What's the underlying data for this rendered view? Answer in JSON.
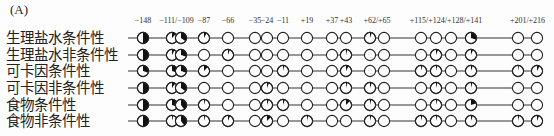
{
  "panel_label": "(A)",
  "site_header_labels": [
    {
      "text": "−148",
      "sites": [
        0
      ]
    },
    {
      "text": "−111/−109",
      "sites": [
        1,
        2
      ]
    },
    {
      "text": "−87",
      "sites": [
        3
      ]
    },
    {
      "text": "−66",
      "sites": [
        4
      ]
    },
    {
      "text": "−35",
      "sites": [
        5
      ]
    },
    {
      "text": "−24",
      "sites": [
        6
      ]
    },
    {
      "text": "−11",
      "sites": [
        7
      ]
    },
    {
      "text": "+19",
      "sites": [
        8
      ]
    },
    {
      "text": "+37",
      "sites": [
        9
      ]
    },
    {
      "text": "+43",
      "sites": [
        10
      ]
    },
    {
      "text": "+62/+65",
      "sites": [
        11,
        12
      ]
    },
    {
      "text": "+115/+124/+128/+141",
      "sites": [
        13,
        14,
        15,
        16
      ]
    },
    {
      "text": "+201/+216",
      "sites": [
        17,
        18
      ]
    }
  ],
  "sites": [
    -148,
    -111,
    -109,
    -87,
    -66,
    -35,
    -24,
    -11,
    19,
    37,
    43,
    62,
    65,
    115,
    124,
    128,
    141,
    201,
    216
  ],
  "fill_color": "#111111",
  "rows": [
    {
      "label": "生理盐水条件性",
      "fills": [
        0.5,
        0.12,
        0.35,
        0.08,
        0,
        0,
        0,
        0,
        0,
        0,
        0,
        0.05,
        0,
        0,
        0,
        0,
        0.3,
        0,
        0
      ]
    },
    {
      "label": "生理盐水非条件性",
      "fills": [
        0.5,
        0.08,
        0.3,
        0,
        0.05,
        0,
        0,
        0,
        0,
        0,
        0.04,
        0,
        0,
        0,
        0.06,
        0,
        0.06,
        0,
        0
      ]
    },
    {
      "label": "可卡因条件性",
      "fills": [
        0.3,
        0.3,
        0.3,
        0.12,
        0,
        0,
        0,
        0.04,
        0,
        0,
        0.08,
        0,
        0,
        0.04,
        0.04,
        0,
        0.05,
        0.03,
        0.08
      ]
    },
    {
      "label": "可卡因非条件性",
      "fills": [
        0.5,
        0.1,
        0.35,
        0,
        0,
        0,
        0.06,
        0,
        0,
        0,
        0.04,
        0.05,
        0,
        0,
        0.04,
        0,
        0.04,
        0,
        0
      ]
    },
    {
      "label": "食物条件性",
      "fills": [
        0.5,
        0.3,
        0.4,
        0.04,
        0,
        0,
        0.05,
        0.05,
        0,
        0,
        0.12,
        0.04,
        0,
        0,
        0.04,
        0,
        0.2,
        0,
        0
      ]
    },
    {
      "label": "食物非条件性",
      "fills": [
        0.5,
        0.04,
        0.4,
        0.04,
        0.06,
        0,
        0.12,
        0,
        0.04,
        0,
        0,
        0.04,
        0,
        0.04,
        0.04,
        0,
        0.05,
        0.04,
        0.06
      ]
    }
  ]
}
